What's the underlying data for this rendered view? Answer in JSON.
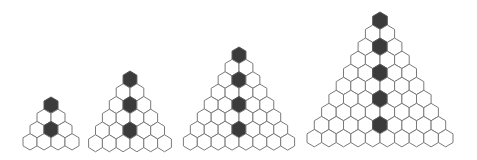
{
  "diagram": {
    "colors": {
      "background": "#ffffff",
      "light_fill": "#ffffff",
      "dark_fill": "#3b3b3b",
      "stroke": "#7a7a7a"
    },
    "figures": [
      {
        "id": "triangle-4",
        "rows": 4,
        "shaded_rows": [
          1,
          3
        ],
        "apex_x": 51,
        "apex_y": 97,
        "hex_w": 14.0,
        "hex_h": 16.3
      },
      {
        "id": "triangle-6",
        "rows": 6,
        "shaded_rows": [
          1,
          3,
          5
        ],
        "apex_x": 130,
        "apex_y": 71,
        "hex_w": 13.8,
        "hex_h": 17.0
      },
      {
        "id": "triangle-8",
        "rows": 8,
        "shaded_rows": [
          1,
          3,
          5,
          7
        ],
        "apex_x": 239,
        "apex_y": 47,
        "hex_w": 13.9,
        "hex_h": 16.5
      },
      {
        "id": "triangle-10",
        "rows": 10,
        "shaded_rows": [
          1,
          3,
          5,
          7,
          9
        ],
        "apex_x": 380,
        "apex_y": 12,
        "hex_w": 14.6,
        "hex_h": 17.4
      }
    ]
  }
}
